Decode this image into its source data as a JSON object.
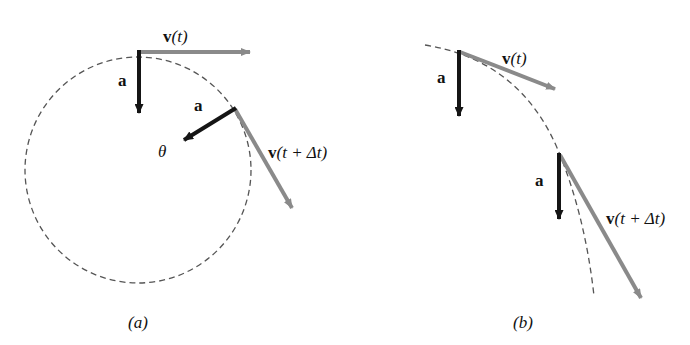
{
  "colors": {
    "velocity": "#8a8a8a",
    "acceleration": "#151515",
    "path": "#555555"
  },
  "panel_a": {
    "caption": "(a)",
    "v_t_label_bold": "v",
    "v_t_label_rest": "(t)",
    "a_label_1": "a",
    "a_label_2": "a",
    "theta_label": "θ",
    "v_tdt_label_bold": "v",
    "v_tdt_label_rest": "(t + Δt)"
  },
  "panel_b": {
    "caption": "(b)",
    "v_t_label_bold": "v",
    "v_t_label_rest": "(t)",
    "a_label_1": "a",
    "a_label_2": "a",
    "v_tdt_label_bold": "v",
    "v_tdt_label_rest": "(t + Δt)"
  }
}
